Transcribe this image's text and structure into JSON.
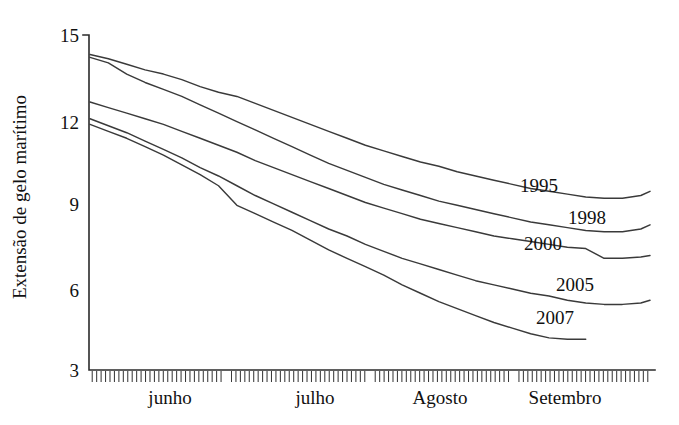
{
  "chart_data": {
    "type": "line",
    "title": "",
    "xlabel": "",
    "ylabel": "Extensão de gelo marítimo",
    "ylim": [
      3,
      15
    ],
    "yticks": [
      3,
      6,
      9,
      12,
      15
    ],
    "ytick_labels": [
      "3",
      "6",
      "9",
      "12",
      "15"
    ],
    "xlim": [
      0,
      122
    ],
    "grid": false,
    "legend_position": "inline-right-of-series",
    "x_axis_kind": "daily-ticks-grouped-by-month",
    "x_month_labels": [
      "junho",
      "julho",
      "Agosto",
      "Setembro"
    ],
    "x_month_day_counts": [
      30,
      31,
      31,
      30
    ],
    "x_unit_note": "days from 1 June through 30 September",
    "series": [
      {
        "name": "1995",
        "label": "1995",
        "x": [
          0,
          4,
          8,
          12,
          16,
          20,
          24,
          28,
          32,
          36,
          40,
          44,
          48,
          52,
          56,
          60,
          64,
          68,
          72,
          76,
          80,
          84,
          88,
          92,
          96,
          100,
          104,
          108,
          112,
          116,
          120,
          122
        ],
        "values": [
          14.3,
          14.15,
          13.95,
          13.75,
          13.6,
          13.4,
          13.15,
          12.95,
          12.8,
          12.55,
          12.3,
          12.05,
          11.8,
          11.55,
          11.3,
          11.05,
          10.85,
          10.65,
          10.45,
          10.3,
          10.1,
          9.95,
          9.8,
          9.65,
          9.5,
          9.4,
          9.3,
          9.2,
          9.15,
          9.15,
          9.25,
          9.4
        ]
      },
      {
        "name": "1998",
        "label": "1998",
        "x": [
          0,
          4,
          8,
          12,
          16,
          20,
          24,
          28,
          32,
          36,
          40,
          44,
          48,
          52,
          56,
          60,
          64,
          68,
          72,
          76,
          80,
          84,
          88,
          92,
          96,
          100,
          104,
          108,
          112,
          116,
          120,
          122
        ],
        "values": [
          14.2,
          14.0,
          13.6,
          13.3,
          13.05,
          12.8,
          12.5,
          12.2,
          11.9,
          11.6,
          11.3,
          11.0,
          10.7,
          10.4,
          10.15,
          9.9,
          9.65,
          9.45,
          9.25,
          9.05,
          8.9,
          8.75,
          8.6,
          8.45,
          8.3,
          8.2,
          8.1,
          8.0,
          7.95,
          7.95,
          8.05,
          8.2
        ]
      },
      {
        "name": "2000",
        "label": "2000",
        "x": [
          0,
          4,
          8,
          12,
          16,
          20,
          24,
          28,
          32,
          36,
          40,
          44,
          48,
          52,
          56,
          60,
          64,
          68,
          72,
          76,
          80,
          84,
          88,
          92,
          96,
          100,
          104,
          108,
          112,
          116,
          120,
          122
        ],
        "values": [
          12.6,
          12.4,
          12.2,
          12.0,
          11.8,
          11.55,
          11.3,
          11.05,
          10.8,
          10.5,
          10.25,
          10.0,
          9.75,
          9.5,
          9.25,
          9.0,
          8.8,
          8.6,
          8.4,
          8.25,
          8.1,
          7.95,
          7.8,
          7.7,
          7.6,
          7.5,
          7.4,
          7.35,
          7.0,
          7.0,
          7.05,
          7.1
        ]
      },
      {
        "name": "2005",
        "label": "2005",
        "x": [
          0,
          4,
          8,
          12,
          16,
          20,
          24,
          28,
          32,
          36,
          40,
          44,
          48,
          52,
          56,
          60,
          64,
          68,
          72,
          76,
          80,
          84,
          88,
          92,
          96,
          100,
          104,
          108,
          112,
          116,
          120,
          122
        ],
        "values": [
          12.0,
          11.75,
          11.5,
          11.2,
          10.9,
          10.6,
          10.25,
          9.95,
          9.6,
          9.25,
          8.95,
          8.65,
          8.35,
          8.05,
          7.8,
          7.5,
          7.25,
          7.0,
          6.8,
          6.6,
          6.4,
          6.2,
          6.05,
          5.9,
          5.75,
          5.65,
          5.5,
          5.4,
          5.35,
          5.35,
          5.4,
          5.5
        ]
      },
      {
        "name": "2007",
        "label": "2007",
        "x": [
          0,
          4,
          8,
          12,
          16,
          20,
          24,
          28,
          32,
          36,
          40,
          44,
          48,
          52,
          56,
          60,
          64,
          68,
          72,
          76,
          80,
          84,
          88,
          92,
          96,
          100,
          104,
          108
        ],
        "values": [
          11.8,
          11.55,
          11.3,
          11.0,
          10.7,
          10.35,
          10.0,
          9.6,
          8.9,
          8.6,
          8.3,
          8.0,
          7.65,
          7.3,
          7.0,
          6.7,
          6.4,
          6.05,
          5.75,
          5.45,
          5.2,
          4.95,
          4.7,
          4.5,
          4.3,
          4.15,
          4.1,
          4.1
        ]
      }
    ],
    "series_label_positions": [
      {
        "name": "1995",
        "x_px": 520,
        "y_px": 192
      },
      {
        "name": "1998",
        "x_px": 568,
        "y_px": 224
      },
      {
        "name": "2000",
        "x_px": 524,
        "y_px": 250
      },
      {
        "name": "2005",
        "x_px": 556,
        "y_px": 291
      },
      {
        "name": "2007",
        "x_px": 536,
        "y_px": 324
      }
    ]
  },
  "axes": {
    "y_axis_title": "Extensão de gelo marítimo",
    "y_tick_labels": [
      "15",
      "12",
      "9",
      "6",
      "3"
    ],
    "x_tick_group_labels": [
      "junho",
      "julho",
      "Agosto",
      "Setembro"
    ]
  }
}
